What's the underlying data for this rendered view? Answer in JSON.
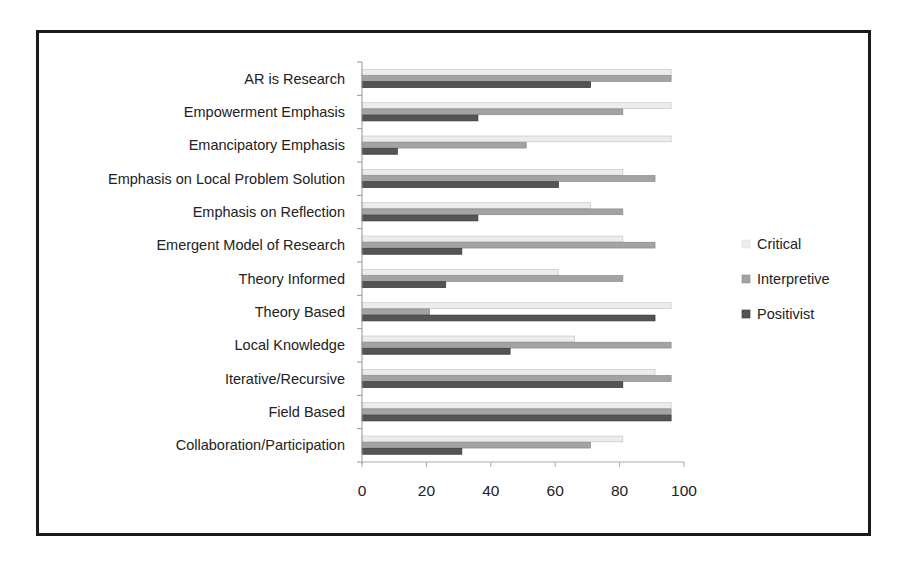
{
  "chart_data": {
    "type": "bar",
    "orientation": "horizontal",
    "title": "",
    "xlabel": "",
    "ylabel": "",
    "xlim": [
      0,
      100
    ],
    "xticks": [
      0,
      20,
      40,
      60,
      80,
      100
    ],
    "grid": false,
    "legend_position": "right",
    "categories": [
      "AR is Research",
      "Empowerment Emphasis",
      "Emancipatory Emphasis",
      "Emphasis on Local Problem Solution",
      "Emphasis on Reflection",
      "Emergent Model of Research",
      "Theory Informed",
      "Theory Based",
      "Local Knowledge",
      "Iterative/Recursive",
      "Field Based",
      "Collaboration/Participation"
    ],
    "series": [
      {
        "name": "Critical",
        "color": "#ececec",
        "stroke": "#c8c8c8",
        "values": [
          96,
          96,
          96,
          81,
          71,
          81,
          61,
          96,
          66,
          91,
          96,
          81
        ]
      },
      {
        "name": "Interpretive",
        "color": "#a3a3a3",
        "stroke": "#8a8a8a",
        "values": [
          96,
          81,
          51,
          91,
          81,
          91,
          81,
          21,
          96,
          96,
          96,
          71
        ]
      },
      {
        "name": "Positivist",
        "color": "#555555",
        "stroke": "#333333",
        "values": [
          71,
          36,
          11,
          61,
          36,
          31,
          26,
          91,
          46,
          81,
          96,
          31
        ]
      }
    ]
  }
}
